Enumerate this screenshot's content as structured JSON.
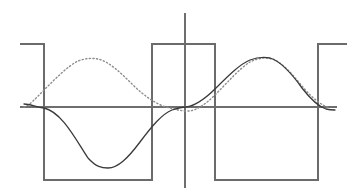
{
  "figure": {
    "width": 354,
    "height": 195,
    "background": "#ffffff"
  },
  "colors": {
    "axis": "#6e6e6e",
    "square_wave": "#6b6b6b",
    "sine_solid": "#3a3a3a",
    "sine_dotted": "#8c8c8c"
  },
  "axes": {
    "x_axis": {
      "label": "horizontal-axis",
      "y": 107,
      "x_start": 20,
      "x_end": 337,
      "stroke_width": 1.2
    },
    "y_axis": {
      "label": "vertical-axis",
      "x": 185,
      "y_start": 13,
      "y_end": 188,
      "stroke_width": 1.2
    },
    "origin": {
      "x": 185,
      "y": 107
    }
  },
  "chart_data": {
    "type": "line",
    "xlabel": "",
    "ylabel": "",
    "grid": false,
    "legend": "none",
    "xlim": [
      20,
      347
    ],
    "ylim": [
      188,
      13
    ],
    "amplitude_px": 50,
    "period_px": 274,
    "series": [
      {
        "name": "square-wave",
        "style": "solid",
        "color": "#6b6b6b",
        "stroke_width": 1.3,
        "high_y": 44,
        "low_y": 180,
        "points": [
          [
            20,
            44
          ],
          [
            44,
            44
          ],
          [
            44,
            180
          ],
          [
            152,
            180
          ],
          [
            152,
            44
          ],
          [
            215,
            44
          ],
          [
            215,
            180
          ],
          [
            318,
            180
          ],
          [
            318,
            44
          ],
          [
            347,
            44
          ]
        ]
      },
      {
        "name": "sine-solid",
        "style": "solid",
        "color": "#3a3a3a",
        "stroke_width": 1.3,
        "phase_deg": 180,
        "zero_crossings_x": [
          44,
          185,
          322
        ],
        "extrema": [
          {
            "type": "min",
            "x": 105,
            "y": 168
          },
          {
            "type": "max",
            "x": 265,
            "y": 57
          }
        ],
        "path": "M 24,104 C 30,104 36,107 44,108 C 62,112 76,140 88,158 C 96,167 102,168 108,168 C 118,168 128,158 140,142 C 152,126 162,114 172,110 C 178,108 182,107 186,107 C 194,106 204,100 216,88 C 228,76 240,64 250,60 C 258,57 264,57 270,58 C 280,61 292,74 302,88 C 312,101 320,107 326,109 C 330,110 333,110 335,110"
      },
      {
        "name": "sine-dotted",
        "style": "dotted",
        "color": "#8c8c8c",
        "stroke_width": 1.4,
        "dash_array": "1.2 2.4",
        "phase_deg": 225,
        "extrema": [
          {
            "type": "max",
            "x": 95,
            "y": 58
          },
          {
            "type": "min",
            "x": 190,
            "y": 111
          }
        ],
        "path": "M 24,107 C 30,105 36,98 44,90 C 56,78 68,66 78,61 C 86,58 92,58 98,59 C 108,61 120,72 132,84 C 144,96 156,104 166,107 C 174,109 180,111 188,111 C 196,111 206,104 216,94 C 228,82 240,68 250,62 C 258,58 266,57 272,59 C 282,62 292,74 302,86 C 312,98 322,106 330,108"
      }
    ]
  },
  "elements": {
    "square_wave_name": "square-wave",
    "sine_solid_name": "fundamental-sine-solid",
    "sine_dotted_name": "shifted-sine-dotted"
  }
}
